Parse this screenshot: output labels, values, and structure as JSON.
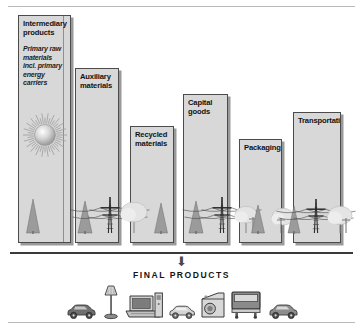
{
  "figure": {
    "name": "material-flow-diagram",
    "arrow_glyph": "⬇",
    "final_caption": "FINAL PRODUCTS",
    "colors": {
      "bar_fill": "#d8d8d8",
      "bar_border": "#4b4b4b",
      "bar_shadow": "#9a9a9a",
      "ground": "#3a3a3a",
      "rule": "#b9b9b9",
      "text": "#121212"
    }
  },
  "chart_data": {
    "type": "bar",
    "title": "",
    "subtitle": "",
    "xlabel": "",
    "ylabel": "",
    "grid": false,
    "legend": "none",
    "categories": [
      "Intermediary products",
      "Auxiliary materials",
      "Recycled materials",
      "Capital goods",
      "Packaging",
      "Transportation"
    ],
    "values": [
      100,
      76,
      50,
      66,
      43,
      56
    ],
    "ylim": [
      0,
      100
    ],
    "annotations": [
      "Primary raw materials incl. primary energy carriers",
      "FINAL PRODUCTS"
    ]
  },
  "bars": [
    {
      "id": "intermediary-products",
      "label": "Intermediary\nproducts",
      "subtitle": "Primary raw\nmaterials\nincl. primary\nenergy carriers",
      "has_sun": true,
      "has_seam": true,
      "x": 18,
      "width": 53,
      "height": 228
    },
    {
      "id": "auxiliary-materials",
      "label": "Auxiliary\nmaterials",
      "subtitle": "",
      "has_sun": false,
      "has_seam": false,
      "x": 75,
      "width": 44,
      "height": 175
    },
    {
      "id": "recycled-materials",
      "label": "Recycled\nmaterials",
      "subtitle": "",
      "has_sun": false,
      "has_seam": false,
      "x": 130,
      "width": 44,
      "height": 117
    },
    {
      "id": "capital-goods",
      "width": 45,
      "label": "Capital goods",
      "subtitle": "",
      "has_sun": false,
      "has_seam": false,
      "x": 183,
      "height": 149
    },
    {
      "id": "packaging",
      "label": "Packaging",
      "subtitle": "",
      "has_sun": false,
      "has_seam": false,
      "x": 239,
      "width": 43,
      "height": 104
    },
    {
      "id": "transportation",
      "label": "Transportation",
      "subtitle": "",
      "has_sun": false,
      "has_seam": false,
      "x": 293,
      "width": 48,
      "height": 131
    }
  ],
  "products": [
    {
      "id": "car-dark",
      "name": "car-icon"
    },
    {
      "id": "floor-lamp",
      "name": "floor-lamp-icon"
    },
    {
      "id": "computer",
      "name": "computer-icon"
    },
    {
      "id": "refrigerator",
      "name": "refrigerator-icon"
    },
    {
      "id": "car-small",
      "name": "car-icon"
    },
    {
      "id": "washing-machine",
      "name": "washing-machine-icon"
    },
    {
      "id": "truck",
      "name": "truck-icon"
    },
    {
      "id": "car-right",
      "name": "car-icon"
    }
  ]
}
